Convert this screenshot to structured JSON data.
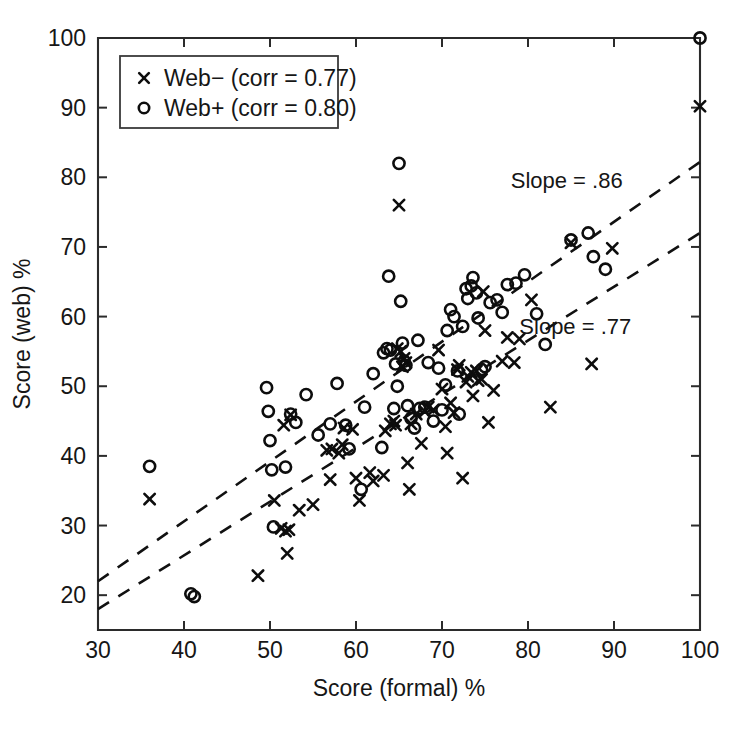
{
  "chart_data": {
    "type": "scatter",
    "title": "",
    "xlabel": "Score (formal) %",
    "ylabel": "Score (web) %",
    "xlim": [
      30,
      100
    ],
    "ylim": [
      15,
      100
    ],
    "xticks": [
      30,
      40,
      50,
      60,
      70,
      80,
      90,
      100
    ],
    "yticks": [
      20,
      30,
      40,
      50,
      60,
      70,
      80,
      90,
      100
    ],
    "grid": false,
    "legend_position": "upper-left",
    "legend": [
      {
        "label": "Web− (corr = 0.77)",
        "marker": "x"
      },
      {
        "label": "Web+ (corr = 0.80)",
        "marker": "o"
      }
    ],
    "annotations": [
      {
        "text": "Slope = .86",
        "x": 84.5,
        "y": 78.5
      },
      {
        "text": "Slope = .77",
        "x": 85.5,
        "y": 57.5
      }
    ],
    "trendlines": [
      {
        "name": "Web+ fit",
        "slope": 0.86,
        "x": [
          30,
          100
        ],
        "y": [
          22.0,
          82.2
        ]
      },
      {
        "name": "Web− fit",
        "slope": 0.77,
        "x": [
          30,
          100
        ],
        "y": [
          18.0,
          72.0
        ]
      }
    ],
    "series": [
      {
        "name": "Web− (corr = 0.77)",
        "marker": "x",
        "corr": 0.77,
        "points": [
          [
            36.0,
            33.8
          ],
          [
            48.6,
            22.8
          ],
          [
            50.5,
            33.6
          ],
          [
            51.3,
            29.6
          ],
          [
            51.8,
            29.2
          ],
          [
            52.2,
            29.4
          ],
          [
            52.0,
            26.0
          ],
          [
            52.4,
            45.9
          ],
          [
            51.6,
            44.4
          ],
          [
            53.4,
            32.2
          ],
          [
            55.0,
            33.0
          ],
          [
            56.6,
            40.8
          ],
          [
            57.2,
            41.0
          ],
          [
            57.0,
            36.6
          ],
          [
            58.0,
            40.4
          ],
          [
            58.4,
            41.6
          ],
          [
            58.6,
            44.0
          ],
          [
            59.6,
            43.8
          ],
          [
            60.0,
            36.8
          ],
          [
            60.4,
            33.6
          ],
          [
            61.6,
            37.6
          ],
          [
            62.0,
            36.4
          ],
          [
            63.2,
            37.2
          ],
          [
            63.4,
            43.6
          ],
          [
            64.0,
            44.6
          ],
          [
            64.4,
            45.0
          ],
          [
            64.6,
            44.4
          ],
          [
            65.0,
            76.0
          ],
          [
            64.8,
            55.4
          ],
          [
            65.2,
            55.0
          ],
          [
            65.4,
            52.8
          ],
          [
            65.6,
            54.0
          ],
          [
            65.8,
            53.4
          ],
          [
            66.0,
            39.0
          ],
          [
            66.2,
            35.2
          ],
          [
            66.4,
            44.6
          ],
          [
            67.0,
            46.0
          ],
          [
            67.6,
            41.8
          ],
          [
            68.0,
            46.4
          ],
          [
            68.4,
            47.0
          ],
          [
            69.0,
            46.6
          ],
          [
            69.6,
            55.2
          ],
          [
            70.0,
            49.6
          ],
          [
            70.4,
            44.2
          ],
          [
            70.6,
            40.4
          ],
          [
            71.0,
            47.6
          ],
          [
            71.4,
            46.2
          ],
          [
            71.8,
            52.4
          ],
          [
            72.0,
            53.0
          ],
          [
            72.4,
            36.8
          ],
          [
            72.8,
            50.6
          ],
          [
            73.0,
            51.4
          ],
          [
            73.4,
            52.0
          ],
          [
            73.6,
            48.6
          ],
          [
            74.0,
            52.2
          ],
          [
            74.2,
            50.8
          ],
          [
            74.6,
            51.0
          ],
          [
            74.8,
            63.6
          ],
          [
            75.0,
            58.0
          ],
          [
            75.4,
            44.8
          ],
          [
            76.0,
            49.4
          ],
          [
            77.0,
            53.6
          ],
          [
            77.6,
            57.0
          ],
          [
            78.4,
            53.4
          ],
          [
            79.0,
            56.8
          ],
          [
            80.4,
            62.4
          ],
          [
            82.6,
            47.0
          ],
          [
            85.0,
            70.6
          ],
          [
            87.4,
            53.2
          ],
          [
            89.8,
            69.8
          ],
          [
            100.0,
            90.2
          ]
        ]
      },
      {
        "name": "Web+ (corr = 0.80)",
        "marker": "o",
        "corr": 0.8,
        "points": [
          [
            36.0,
            38.5
          ],
          [
            40.8,
            20.2
          ],
          [
            41.2,
            19.8
          ],
          [
            49.6,
            49.8
          ],
          [
            49.8,
            46.4
          ],
          [
            50.0,
            42.2
          ],
          [
            50.2,
            38.0
          ],
          [
            50.4,
            29.8
          ],
          [
            51.8,
            38.4
          ],
          [
            52.4,
            46.0
          ],
          [
            53.0,
            44.8
          ],
          [
            54.2,
            48.8
          ],
          [
            55.6,
            43.0
          ],
          [
            57.0,
            44.6
          ],
          [
            57.8,
            50.4
          ],
          [
            58.8,
            44.4
          ],
          [
            59.2,
            41.0
          ],
          [
            60.6,
            35.2
          ],
          [
            61.0,
            47.0
          ],
          [
            62.0,
            51.8
          ],
          [
            63.0,
            41.2
          ],
          [
            63.2,
            54.8
          ],
          [
            63.6,
            55.4
          ],
          [
            63.8,
            65.8
          ],
          [
            64.0,
            55.2
          ],
          [
            64.4,
            46.8
          ],
          [
            64.6,
            53.2
          ],
          [
            64.8,
            50.0
          ],
          [
            65.0,
            82.0
          ],
          [
            65.2,
            62.2
          ],
          [
            65.4,
            56.2
          ],
          [
            65.6,
            53.6
          ],
          [
            65.8,
            53.0
          ],
          [
            66.0,
            47.2
          ],
          [
            66.4,
            45.4
          ],
          [
            66.8,
            44.0
          ],
          [
            67.2,
            56.6
          ],
          [
            67.4,
            46.8
          ],
          [
            68.0,
            47.0
          ],
          [
            68.4,
            53.4
          ],
          [
            69.0,
            45.0
          ],
          [
            69.6,
            52.6
          ],
          [
            70.0,
            46.6
          ],
          [
            70.4,
            50.2
          ],
          [
            70.6,
            58.0
          ],
          [
            71.0,
            61.0
          ],
          [
            71.4,
            60.0
          ],
          [
            71.8,
            52.2
          ],
          [
            72.0,
            46.0
          ],
          [
            72.4,
            58.6
          ],
          [
            72.8,
            64.0
          ],
          [
            73.0,
            62.6
          ],
          [
            73.4,
            64.4
          ],
          [
            73.6,
            65.6
          ],
          [
            74.0,
            63.4
          ],
          [
            74.2,
            59.8
          ],
          [
            74.6,
            52.4
          ],
          [
            75.0,
            52.8
          ],
          [
            75.6,
            62.0
          ],
          [
            76.4,
            62.4
          ],
          [
            77.0,
            60.6
          ],
          [
            77.6,
            64.6
          ],
          [
            78.6,
            64.8
          ],
          [
            79.6,
            66.0
          ],
          [
            81.0,
            60.4
          ],
          [
            82.0,
            56.0
          ],
          [
            85.0,
            71.0
          ],
          [
            87.0,
            72.0
          ],
          [
            87.6,
            68.6
          ],
          [
            89.0,
            66.8
          ],
          [
            100.0,
            100.0
          ]
        ]
      }
    ]
  },
  "layout": {
    "plot_left": 98,
    "plot_right": 700,
    "plot_top": 38,
    "plot_bottom": 630
  }
}
